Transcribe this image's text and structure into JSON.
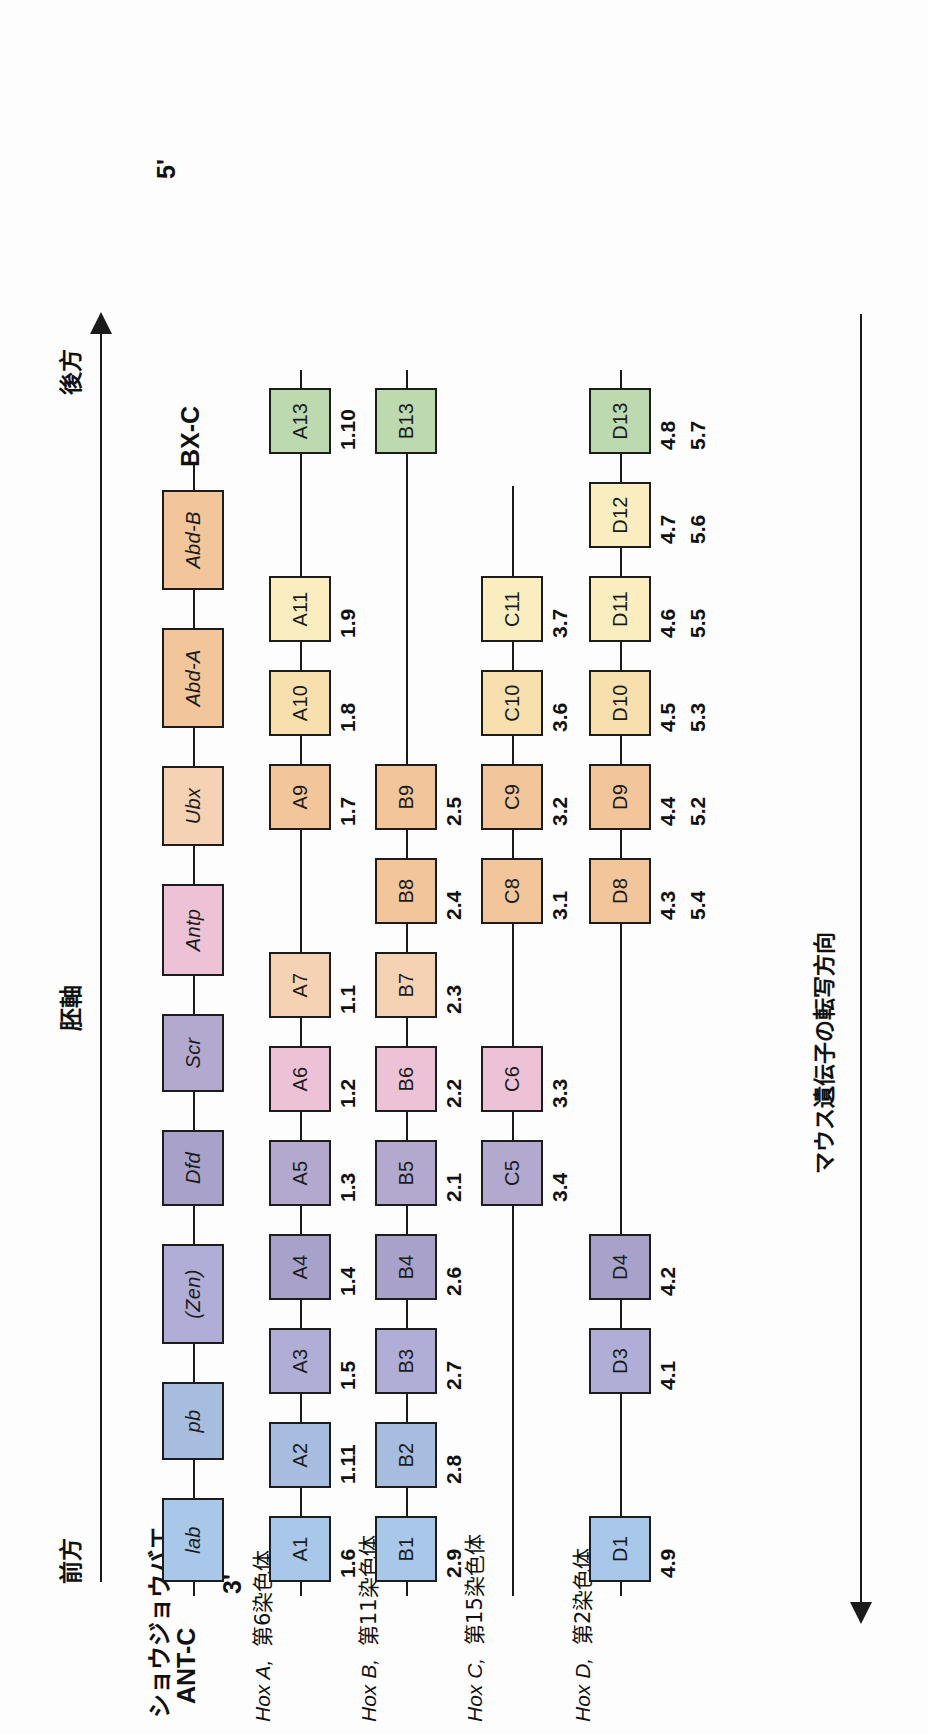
{
  "figure": {
    "organisms": {
      "drosophila": "ショウジョウバエ",
      "mouse": "マウス"
    },
    "axis": {
      "anterior": "前方",
      "posterior": "後方",
      "embryo_axis": "胚軸",
      "three_prime": "3'",
      "five_prime": "5'",
      "transcription_direction": "マウス遺伝子の転写方向"
    },
    "clusters": [
      {
        "id": "drosophila",
        "left_label": "ANT-C",
        "right_label": "BX-C",
        "genes": [
          {
            "name": "lab",
            "color": "#a9c7e8"
          },
          {
            "name": "pb",
            "color": "#a7bddf"
          },
          {
            "name": "(Zen)",
            "color": "#b0aed6"
          },
          {
            "name": "Dfd",
            "color": "#a8a2cb"
          },
          {
            "name": "Scr",
            "color": "#b3a9cf"
          },
          {
            "name": "Antp",
            "color": "#edc2d6"
          },
          {
            "name": "Ubx",
            "color": "#f6d2b4"
          },
          {
            "name": "Abd-A",
            "color": "#f2c69a"
          },
          {
            "name": "Abd-B",
            "color": "#f2c69a"
          }
        ]
      },
      {
        "id": "hoxa",
        "species_label": "Hox A,",
        "chromosome_label": "第6染色体",
        "genes": [
          {
            "name": "A1",
            "number": "1.6",
            "color": "#a9c7e8",
            "pos": 0
          },
          {
            "name": "A2",
            "number": "1.11",
            "color": "#a7bddf",
            "pos": 1
          },
          {
            "name": "A3",
            "number": "1.5",
            "color": "#b0aed6",
            "pos": 2
          },
          {
            "name": "A4",
            "number": "1.4",
            "color": "#a8a2cb",
            "pos": 3
          },
          {
            "name": "A5",
            "number": "1.3",
            "color": "#b3a9cf",
            "pos": 4
          },
          {
            "name": "A6",
            "number": "1.2",
            "color": "#edc2d6",
            "pos": 5
          },
          {
            "name": "A7",
            "number": "1.1",
            "color": "#f6d2b4",
            "pos": 6
          },
          {
            "name": "A9",
            "number": "1.7",
            "color": "#f2c69a",
            "pos": 8
          },
          {
            "name": "A10",
            "number": "1.8",
            "color": "#f7dfae",
            "pos": 9
          },
          {
            "name": "A11",
            "number": "1.9",
            "color": "#faeec0",
            "pos": 10
          },
          {
            "name": "A13",
            "number": "1.10",
            "color": "#bcd9b0",
            "pos": 12
          }
        ]
      },
      {
        "id": "hoxb",
        "species_label": "Hox B,",
        "chromosome_label": "第11染色体",
        "genes": [
          {
            "name": "B1",
            "number": "2.9",
            "color": "#a9c7e8",
            "pos": 0
          },
          {
            "name": "B2",
            "number": "2.8",
            "color": "#a7bddf",
            "pos": 1
          },
          {
            "name": "B3",
            "number": "2.7",
            "color": "#b0aed6",
            "pos": 2
          },
          {
            "name": "B4",
            "number": "2.6",
            "color": "#a8a2cb",
            "pos": 3
          },
          {
            "name": "B5",
            "number": "2.1",
            "color": "#b3a9cf",
            "pos": 4
          },
          {
            "name": "B6",
            "number": "2.2",
            "color": "#edc2d6",
            "pos": 5
          },
          {
            "name": "B7",
            "number": "2.3",
            "color": "#f6d2b4",
            "pos": 6
          },
          {
            "name": "B8",
            "number": "2.4",
            "color": "#f2c69a",
            "pos": 7
          },
          {
            "name": "B9",
            "number": "2.5",
            "color": "#f2c69a",
            "pos": 8
          },
          {
            "name": "B13",
            "number": "",
            "color": "#bcd9b0",
            "pos": 12
          }
        ]
      },
      {
        "id": "hoxc",
        "species_label": "Hox C,",
        "chromosome_label": "第15染色体",
        "genes": [
          {
            "name": "C5",
            "number": "3.4",
            "color": "#b3a9cf",
            "pos": 4
          },
          {
            "name": "C6",
            "number": "3.3",
            "color": "#edc2d6",
            "pos": 5
          },
          {
            "name": "C8",
            "number": "3.1",
            "color": "#f2c69a",
            "pos": 7
          },
          {
            "name": "C9",
            "number": "3.2",
            "color": "#f2c69a",
            "pos": 8
          },
          {
            "name": "C10",
            "number": "3.6",
            "color": "#f7dfae",
            "pos": 9
          },
          {
            "name": "C11",
            "number": "3.7",
            "color": "#faeec0",
            "pos": 10
          }
        ]
      },
      {
        "id": "hoxd",
        "species_label": "Hox D,",
        "chromosome_label": "第2染色体",
        "genes": [
          {
            "name": "D1",
            "number": "4.9",
            "number2": "",
            "color": "#a9c7e8",
            "pos": 0
          },
          {
            "name": "D3",
            "number": "4.1",
            "number2": "",
            "color": "#b0aed6",
            "pos": 2
          },
          {
            "name": "D4",
            "number": "4.2",
            "number2": "",
            "color": "#a8a2cb",
            "pos": 3
          },
          {
            "name": "D8",
            "number": "4.3",
            "number2": "5.4",
            "color": "#f2c69a",
            "pos": 7
          },
          {
            "name": "D9",
            "number": "4.4",
            "number2": "5.2",
            "color": "#f2c69a",
            "pos": 8
          },
          {
            "name": "D10",
            "number": "4.5",
            "number2": "5.3",
            "color": "#f7dfae",
            "pos": 9
          },
          {
            "name": "D11",
            "number": "4.6",
            "number2": "5.5",
            "color": "#faeec0",
            "pos": 10
          },
          {
            "name": "D12",
            "number": "4.7",
            "number2": "5.6",
            "color": "#faeec0",
            "pos": 11
          },
          {
            "name": "D13",
            "number": "4.8",
            "number2": "5.7",
            "color": "#bcd9b0",
            "pos": 12
          }
        ]
      }
    ]
  }
}
